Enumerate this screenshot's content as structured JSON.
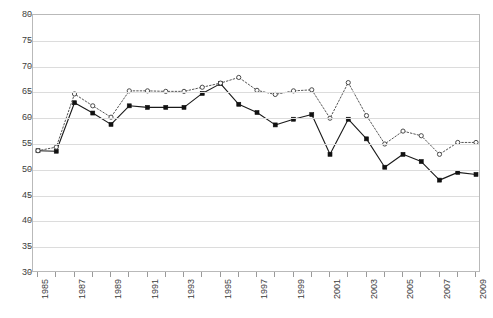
{
  "chart_data": {
    "type": "line",
    "title": "",
    "xlabel": "",
    "ylabel": "",
    "ylim": [
      30,
      80
    ],
    "ytick_step": 5,
    "yticks": [
      30,
      35,
      40,
      45,
      50,
      55,
      60,
      65,
      70,
      75,
      80
    ],
    "grid": true,
    "legend": "none",
    "xlim": [
      1985,
      2009
    ],
    "x": [
      1985,
      1986,
      1987,
      1988,
      1989,
      1990,
      1991,
      1992,
      1993,
      1994,
      1995,
      1996,
      1997,
      1998,
      1999,
      2000,
      2001,
      2002,
      2003,
      2004,
      2005,
      2006,
      2007,
      2008,
      2009
    ],
    "xtick_labels": [
      "1985",
      "",
      "1987",
      "",
      "1989",
      "",
      "1991",
      "",
      "1993",
      "",
      "1995",
      "",
      "1997",
      "",
      "1999",
      "",
      "2001",
      "",
      "2003",
      "",
      "2005",
      "",
      "2007",
      "",
      "2009"
    ],
    "series": [
      {
        "name": "series-solid-square",
        "marker": "filled-square",
        "linestyle": "solid",
        "color": "#111111",
        "values": [
          53.7,
          53.6,
          63.0,
          61.0,
          58.8,
          62.4,
          62.1,
          62.1,
          62.1,
          64.8,
          66.7,
          62.7,
          61.1,
          58.7,
          59.8,
          60.7,
          53.0,
          59.8,
          56.0,
          50.5,
          53.0,
          51.6,
          48.0,
          49.5,
          49.1
        ]
      },
      {
        "name": "series-dotted-circle",
        "marker": "open-circle",
        "linestyle": "dotted",
        "color": "#4a4a4a",
        "values": [
          53.7,
          54.4,
          64.7,
          62.4,
          60.2,
          65.3,
          65.3,
          65.2,
          65.2,
          66.0,
          66.8,
          67.9,
          65.4,
          64.6,
          65.3,
          65.5,
          60.0,
          66.9,
          60.5,
          55.0,
          57.5,
          56.6,
          53.0,
          55.3,
          55.3
        ]
      }
    ]
  }
}
